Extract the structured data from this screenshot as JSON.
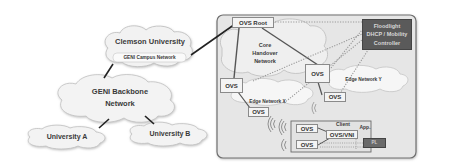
{
  "left": {
    "clemson": {
      "title": "Clemson University",
      "subtitle": "GENI Campus Network"
    },
    "backbone": {
      "line1": "GENI Backbone",
      "line2": "Network"
    },
    "univ_a": "University A",
    "univ_b": "University B"
  },
  "right": {
    "ovs_root": "OVS Root",
    "core": {
      "line1": "Core",
      "line2": "Handover",
      "line3": "Network"
    },
    "controller": {
      "line1": "Floodlight",
      "line2": "DHCP / Mobility",
      "line3": "Controller"
    },
    "ovs_core_right": "OVS",
    "ovs_core_left": "OVS",
    "edge_x": "Edge Network X",
    "edge_y": "Edge Network Y",
    "ovs_edge_x": "OVS",
    "ovs_edge_y": "OVS",
    "client": {
      "title": "Client",
      "ovs_top": "OVS",
      "ovs_bottom": "OVS",
      "ovs_vni": "OVS/VNI",
      "app": "App.",
      "pl": "PL"
    }
  },
  "colors": {
    "panel_bg": "#e6e6e6",
    "panel_border": "#7a7a7a",
    "controller_bg": "#5a5a5a",
    "cloud_fill": "#f2f2f2"
  }
}
